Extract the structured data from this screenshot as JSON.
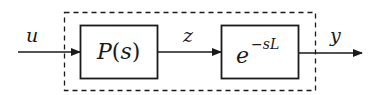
{
  "diagram": {
    "type": "block-diagram",
    "input_signal": "u",
    "intermediate_signal": "z",
    "output_signal": "y",
    "blocks": [
      {
        "id": "plant",
        "label_main": "P",
        "label_paren_open": "(",
        "label_var": "s",
        "label_paren_close": ")"
      },
      {
        "id": "delay",
        "label_base": "e",
        "label_exp": "−sL"
      }
    ],
    "grouping": "dashed-box-enclosing-both-blocks",
    "colors": {
      "stroke": "#1a1a1a",
      "background": "#ffffff"
    }
  }
}
